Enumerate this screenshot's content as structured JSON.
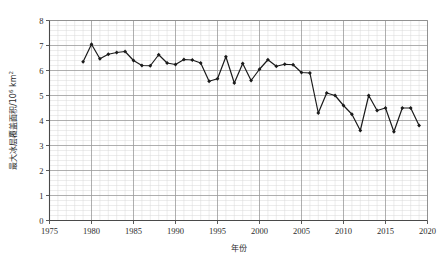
{
  "chart_data": {
    "type": "line",
    "title": "",
    "xlabel": "年份",
    "ylabel": "最大冰层覆盖面积/10⁶ km²",
    "ylabel_parts": {
      "main": "最大冰层覆盖面积/10",
      "exponent": "6",
      "unit": " km",
      "unit_exponent": "2"
    },
    "xlim": [
      1975,
      2020
    ],
    "ylim": [
      0,
      8
    ],
    "xticks": [
      1975,
      1980,
      1985,
      1990,
      1995,
      2000,
      2005,
      2010,
      2015,
      2020
    ],
    "yticks": [
      0,
      1,
      2,
      3,
      4,
      5,
      6,
      7,
      8
    ],
    "grid": true,
    "minor_grid": true,
    "minor_divisions": 5,
    "legend": "none",
    "marker": "diamond",
    "line_color": "#1a1a1a",
    "marker_color": "#1a1a1a",
    "grid_color": "#9a9a9a",
    "minor_grid_color": "#d8d8d8",
    "axis_color": "#555555",
    "background": "#ffffff",
    "x": [
      1979,
      1980,
      1981,
      1982,
      1983,
      1984,
      1985,
      1986,
      1987,
      1988,
      1989,
      1990,
      1991,
      1992,
      1993,
      1994,
      1995,
      1996,
      1997,
      1998,
      1999,
      2000,
      2001,
      2002,
      2003,
      2004,
      2005,
      2006,
      2007,
      2008,
      2009,
      2010,
      2011,
      2012,
      2013,
      2014,
      2015,
      2016,
      2017,
      2018,
      2019
    ],
    "values": [
      6.35,
      7.05,
      6.47,
      6.65,
      6.72,
      6.76,
      6.4,
      6.2,
      6.19,
      6.63,
      6.3,
      6.24,
      6.44,
      6.42,
      6.3,
      5.57,
      5.67,
      6.55,
      5.5,
      6.28,
      5.6,
      6.05,
      6.43,
      6.17,
      6.25,
      6.23,
      5.92,
      5.9,
      4.3,
      5.1,
      5.0,
      4.6,
      4.25,
      3.6,
      5.0,
      4.4,
      4.5,
      3.55,
      4.5,
      4.5,
      3.8
    ]
  }
}
